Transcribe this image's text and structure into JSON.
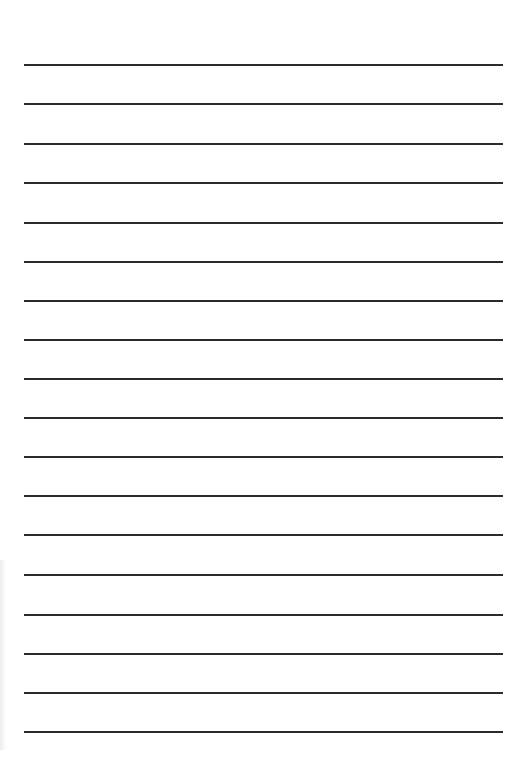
{
  "page": {
    "type": "lined-paper",
    "background_color": "#ffffff",
    "line_color": "#2b2b2b",
    "line_count": 18,
    "line_left": 24,
    "line_right": 503,
    "lines_y": [
      64,
      103,
      143,
      182,
      222,
      261,
      300,
      339,
      378,
      417,
      456,
      495,
      534,
      574,
      614,
      653,
      692,
      731
    ]
  }
}
